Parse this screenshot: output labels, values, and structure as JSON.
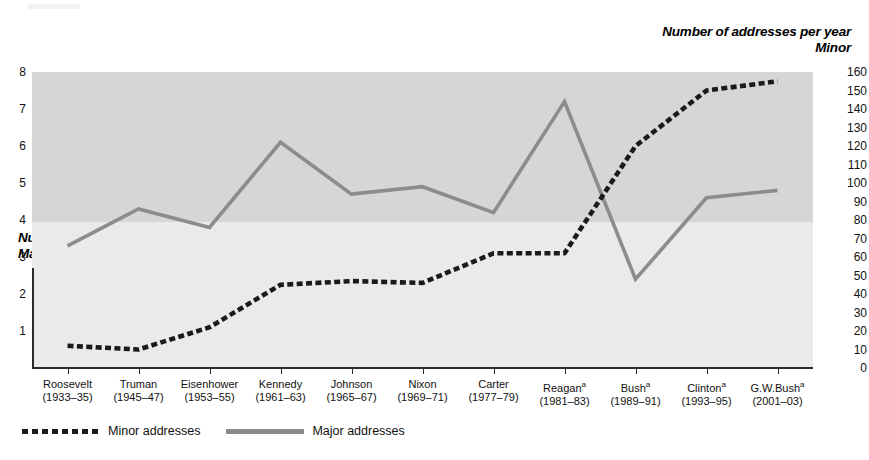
{
  "chart_data": {
    "type": "line",
    "title": "",
    "categories": [
      "Roosevelt\n(1933–35)",
      "Truman\n(1945–47)",
      "Eisenhower\n(1953–55)",
      "Kennedy\n(1961–63)",
      "Johnson\n(1965–67)",
      "Nixon\n(1969–71)",
      "Carter\n(1977–79)",
      "Reaganᵃ\n(1981–83)",
      "Bushᵃ\n(1989–91)",
      "Clintonᵃ\n(1993–95)",
      "G.W.Bushᵃ\n(2001–03)"
    ],
    "series": [
      {
        "name": "Minor addresses",
        "axis": "right",
        "color": "#1a1a1a",
        "style": "dotted",
        "values": [
          12,
          10,
          22,
          45,
          47,
          46,
          62,
          62,
          120,
          150,
          155
        ]
      },
      {
        "name": "Major addresses",
        "axis": "left",
        "color": "#8c8c8c",
        "style": "solid",
        "values": [
          3.3,
          4.3,
          3.8,
          6.1,
          4.7,
          4.9,
          4.2,
          7.2,
          2.4,
          4.6,
          4.8
        ]
      }
    ],
    "xlabel": "",
    "ylabel_left": "Number of addresses per year Major",
    "ylabel_right": "Number of addresses per year Minor",
    "ylim_left": [
      0,
      8
    ],
    "ylim_right": [
      0,
      160
    ],
    "grid": false,
    "legend_position": "bottom-left"
  },
  "titles": {
    "right_line1": "Number of addresses per year",
    "right_line2": "Minor",
    "left_line1": "Number of addresses per year",
    "left_line2": "Major"
  },
  "axis_right": {
    "ticks": [
      "160",
      "150",
      "140",
      "130",
      "120",
      "110",
      "100",
      "90",
      "80",
      "70",
      "60",
      "50",
      "40",
      "30",
      "20",
      "10",
      "0"
    ],
    "values": [
      160,
      150,
      140,
      130,
      120,
      110,
      100,
      90,
      80,
      70,
      60,
      50,
      40,
      30,
      20,
      10,
      0
    ]
  },
  "axis_left": {
    "ticks": [
      "8",
      "7",
      "6",
      "5",
      "4",
      "3",
      "2",
      "1"
    ],
    "values": [
      8,
      7,
      6,
      5,
      4,
      3,
      2,
      1
    ]
  },
  "x_categories": [
    {
      "name": "Roosevelt",
      "years": "(1933–35)",
      "sup": ""
    },
    {
      "name": "Truman",
      "years": "(1945–47)",
      "sup": ""
    },
    {
      "name": "Eisenhower",
      "years": "(1953–55)",
      "sup": ""
    },
    {
      "name": "Kennedy",
      "years": "(1961–63)",
      "sup": ""
    },
    {
      "name": "Johnson",
      "years": "(1965–67)",
      "sup": ""
    },
    {
      "name": "Nixon",
      "years": "(1969–71)",
      "sup": ""
    },
    {
      "name": "Carter",
      "years": "(1977–79)",
      "sup": ""
    },
    {
      "name": "Reagan",
      "years": "(1981–83)",
      "sup": "a"
    },
    {
      "name": "Bush",
      "years": "(1989–91)",
      "sup": "a"
    },
    {
      "name": "Clinton",
      "years": "(1993–95)",
      "sup": "a"
    },
    {
      "name": "G.W.Bush",
      "years": "(2001–03)",
      "sup": "a"
    }
  ],
  "legend": {
    "items": [
      {
        "label": "Minor addresses",
        "style": "dotted",
        "color": "#1a1a1a"
      },
      {
        "label": "Major addresses",
        "style": "solid",
        "color": "#8c8c8c"
      }
    ]
  },
  "colors": {
    "minor_line": "#1a1a1a",
    "major_line": "#8c8c8c",
    "band_upper": "#d6d6d6",
    "band_lower": "#eaeaea",
    "axis": "#2b2b2b",
    "background": "#ffffff"
  }
}
